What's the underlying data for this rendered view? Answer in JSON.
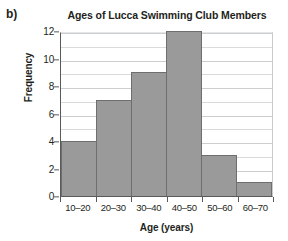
{
  "panel": {
    "label": "b)"
  },
  "chart_data": {
    "type": "bar",
    "title": "Ages of Lucca Swimming Club Members",
    "xlabel": "Age (years)",
    "ylabel": "Frequency",
    "categories": [
      "10–20",
      "20–30",
      "30–40",
      "40–50",
      "50–60",
      "60–70"
    ],
    "values": [
      4,
      7,
      9,
      12,
      3,
      1
    ],
    "ylim": [
      0,
      12
    ],
    "ytick_labels": [
      "0",
      "2",
      "4",
      "6",
      "8",
      "10",
      "12"
    ],
    "ytick_values": [
      0,
      2,
      4,
      6,
      8,
      10,
      12
    ],
    "gridlines": {
      "visible": true,
      "interval": 1,
      "axis": "y"
    },
    "legend": {
      "visible": false
    },
    "colors": {
      "bar_fill": "#9a9a9b",
      "bar_edge": "#6d6e70",
      "axis": "#58595b",
      "gridline": "#d9dadb",
      "text": "#231f20",
      "background": "#ffffff"
    }
  }
}
